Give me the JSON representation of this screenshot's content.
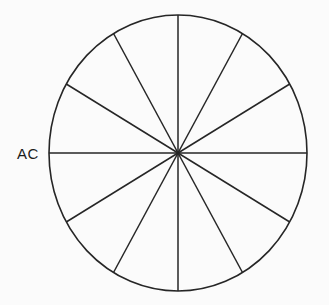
{
  "figure": {
    "name": "sector-circle-diagram",
    "background_color": "#fbfbfb",
    "line_color": "#262626"
  },
  "labels": [
    {
      "id": "ac-label",
      "text": "AC",
      "x": 17,
      "y": 146
    }
  ],
  "chart_data": {
    "type": "pie",
    "title": "",
    "subtitle": "",
    "xlabel": "",
    "ylabel": "",
    "legend": [],
    "grid": false,
    "center": {
      "x": 178,
      "y": 153
    },
    "radius_x": 129,
    "radius_y": 138,
    "sector_count": 12,
    "sector_angle_degrees": 30,
    "equal_sectors": true,
    "categories": [
      "1",
      "2",
      "3",
      "4",
      "5",
      "6",
      "7",
      "8",
      "9",
      "10",
      "11",
      "12"
    ],
    "values": [
      30,
      30,
      30,
      30,
      30,
      30,
      30,
      30,
      30,
      30,
      30,
      30
    ],
    "spoke_angles_degrees": [
      0,
      30,
      60,
      90,
      120,
      150,
      180,
      210,
      240,
      270,
      300,
      330
    ],
    "diameter_count": 6,
    "annotations": [
      "AC"
    ]
  }
}
